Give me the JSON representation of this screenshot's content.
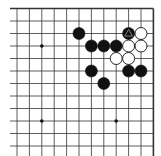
{
  "board": {
    "description": "Go board diagram, upper-right corner section",
    "cols": 12,
    "rows": 12,
    "x_positions": [
      17,
      29.4,
      41.8,
      54.2,
      66.6,
      79,
      91.4,
      103.8,
      116.2,
      128.6,
      141,
      153.4
    ],
    "y_positions": [
      8.5,
      21,
      33.5,
      46,
      58.5,
      71,
      83.5,
      96,
      108.5,
      121,
      133.5,
      146
    ],
    "edge_top": true,
    "edge_right": true,
    "line_color": "#333333",
    "stone_radius": 6,
    "star_points": [
      {
        "col": 2,
        "row": 3
      },
      {
        "col": 2,
        "row": 9
      },
      {
        "col": 8,
        "row": 9
      }
    ],
    "stones": [
      {
        "color": "black",
        "col": 5,
        "row": 2
      },
      {
        "color": "black",
        "col": 9,
        "row": 2,
        "marker": "triangle"
      },
      {
        "color": "white",
        "col": 10,
        "row": 2
      },
      {
        "color": "black",
        "col": 6,
        "row": 3
      },
      {
        "color": "black",
        "col": 7,
        "row": 3
      },
      {
        "color": "black",
        "col": 8,
        "row": 3
      },
      {
        "color": "white",
        "col": 9,
        "row": 3
      },
      {
        "color": "white",
        "col": 10,
        "row": 3
      },
      {
        "color": "white",
        "col": 8,
        "row": 4
      },
      {
        "color": "white",
        "col": 9,
        "row": 4
      },
      {
        "color": "black",
        "col": 6,
        "row": 5
      },
      {
        "color": "black",
        "col": 9,
        "row": 5
      },
      {
        "color": "black",
        "col": 10,
        "row": 5
      },
      {
        "color": "black",
        "col": 7,
        "row": 6
      }
    ]
  }
}
